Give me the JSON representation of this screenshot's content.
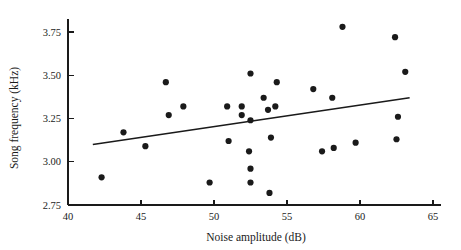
{
  "chart_data": {
    "type": "scatter",
    "title": "",
    "xlabel": "Noise amplitude (dB)",
    "ylabel": "Song frequency (kHz)",
    "xlim": [
      40,
      65
    ],
    "ylim": [
      2.75,
      3.75
    ],
    "xticks": [
      "40",
      "45",
      "50",
      "55",
      "60",
      "65"
    ],
    "xtick_values": [
      40,
      45,
      50,
      55,
      60,
      65
    ],
    "yticks": [
      "2.75",
      "3.00",
      "3.25",
      "3.50",
      "3.75"
    ],
    "ytick_values": [
      2.75,
      3.0,
      3.25,
      3.5,
      3.75
    ],
    "grid": false,
    "legend": null,
    "marker_color": "#1a1a1a",
    "line_color": "#1a1a1a",
    "points": [
      {
        "x": 42.3,
        "y": 2.91
      },
      {
        "x": 43.8,
        "y": 3.17
      },
      {
        "x": 45.3,
        "y": 3.09
      },
      {
        "x": 46.7,
        "y": 3.46
      },
      {
        "x": 46.9,
        "y": 3.27
      },
      {
        "x": 47.9,
        "y": 3.32
      },
      {
        "x": 49.7,
        "y": 2.88
      },
      {
        "x": 50.9,
        "y": 3.32
      },
      {
        "x": 51.0,
        "y": 3.12
      },
      {
        "x": 51.9,
        "y": 3.32
      },
      {
        "x": 51.9,
        "y": 3.27
      },
      {
        "x": 52.4,
        "y": 3.06
      },
      {
        "x": 52.5,
        "y": 3.51
      },
      {
        "x": 52.5,
        "y": 3.24
      },
      {
        "x": 52.5,
        "y": 2.96
      },
      {
        "x": 52.5,
        "y": 2.88
      },
      {
        "x": 53.4,
        "y": 3.37
      },
      {
        "x": 53.7,
        "y": 3.3
      },
      {
        "x": 53.8,
        "y": 2.82
      },
      {
        "x": 53.9,
        "y": 3.14
      },
      {
        "x": 54.2,
        "y": 3.32
      },
      {
        "x": 54.3,
        "y": 3.46
      },
      {
        "x": 56.8,
        "y": 3.42
      },
      {
        "x": 57.4,
        "y": 3.06
      },
      {
        "x": 58.1,
        "y": 3.37
      },
      {
        "x": 58.2,
        "y": 3.08
      },
      {
        "x": 58.8,
        "y": 3.78
      },
      {
        "x": 59.7,
        "y": 3.11
      },
      {
        "x": 62.4,
        "y": 3.72
      },
      {
        "x": 62.5,
        "y": 3.13
      },
      {
        "x": 62.6,
        "y": 3.26
      },
      {
        "x": 63.1,
        "y": 3.52
      }
    ],
    "regression_line": {
      "x_start": 41.7,
      "y_start": 3.1,
      "x_end": 63.4,
      "y_end": 3.37
    }
  }
}
